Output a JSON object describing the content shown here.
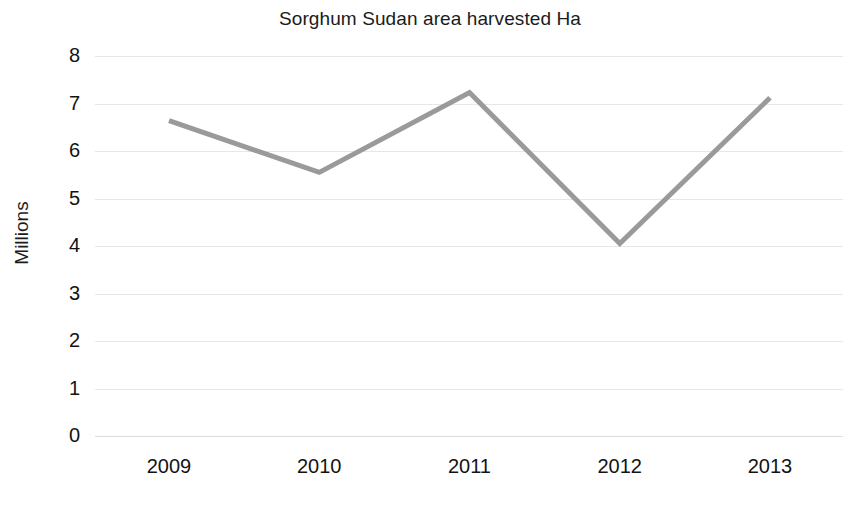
{
  "chart_data": {
    "type": "line",
    "title": "Sorghum Sudan area harvested Ha",
    "xlabel": "",
    "ylabel": "Millions",
    "categories": [
      "2009",
      "2010",
      "2011",
      "2012",
      "2013"
    ],
    "values": [
      6.64,
      5.55,
      7.23,
      4.05,
      7.12
    ],
    "series": [
      {
        "name": "Sorghum Sudan area harvested Ha",
        "values": [
          6.64,
          5.55,
          7.23,
          4.05,
          7.12
        ],
        "color": "#9a9a9a"
      }
    ],
    "ylim": [
      0,
      8
    ],
    "y_ticks": [
      "0",
      "1",
      "2",
      "3",
      "4",
      "5",
      "6",
      "7",
      "8"
    ],
    "y_tick_values": [
      0,
      1,
      2,
      3,
      4,
      5,
      6,
      7,
      8
    ],
    "grid": "horizontal",
    "gridline_color": "#e7e7ea",
    "legend": "none",
    "markers": "none",
    "units": "Millions",
    "line_color": "#9a9a9a",
    "line_width": 5,
    "background_color": "#ffffff",
    "text_color": "#131313"
  }
}
